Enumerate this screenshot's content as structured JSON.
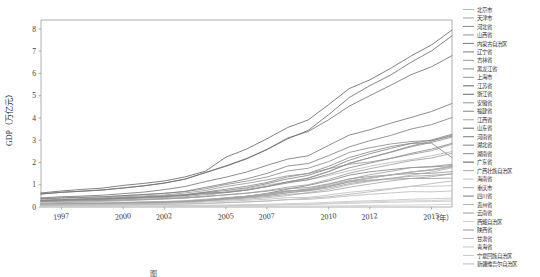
{
  "chart_data": {
    "type": "line",
    "title": "",
    "xlabel": "（年）",
    "ylabel": "GDP（万亿元）",
    "xlim": [
      1996,
      2016
    ],
    "ylim": [
      0,
      8.4
    ],
    "grid": false,
    "legend_position": "right",
    "x": [
      1996,
      1997,
      1998,
      1999,
      2000,
      2001,
      2002,
      2003,
      2004,
      2005,
      2006,
      2007,
      2008,
      2009,
      2010,
      2011,
      2012,
      2013,
      2014,
      2015,
      2016
    ],
    "xtick_labels": [
      "1997",
      "2000",
      "2002",
      "2005",
      "2007",
      "2010",
      "2012",
      "2015"
    ],
    "xtick_values": [
      1997,
      2000,
      2002,
      2005,
      2007,
      2010,
      2012,
      2015
    ],
    "ytick_labels": [
      "0",
      "1",
      "2",
      "3",
      "4",
      "5",
      "6",
      "7",
      "8"
    ],
    "ytick_values": [
      0,
      1,
      2,
      3,
      4,
      5,
      6,
      7,
      8
    ],
    "series": [
      {
        "name": "北京市",
        "color": "#b9b9b9",
        "values": [
          0.17,
          0.2,
          0.23,
          0.25,
          0.28,
          0.32,
          0.36,
          0.41,
          0.49,
          0.69,
          0.82,
          0.99,
          1.12,
          1.22,
          1.41,
          1.63,
          1.83,
          2.0,
          2.13,
          2.3,
          2.49
        ]
      },
      {
        "name": "天津市",
        "color": "#a8a8a8",
        "values": [
          0.11,
          0.12,
          0.14,
          0.15,
          0.16,
          0.18,
          0.21,
          0.25,
          0.31,
          0.37,
          0.44,
          0.51,
          0.64,
          0.75,
          0.92,
          1.13,
          1.29,
          1.44,
          1.57,
          1.65,
          1.79
        ]
      },
      {
        "name": "河北省",
        "color": "#8f8f8f",
        "values": [
          0.36,
          0.4,
          0.43,
          0.45,
          0.51,
          0.56,
          0.62,
          0.69,
          0.82,
          1.01,
          1.16,
          1.35,
          1.62,
          1.74,
          2.04,
          2.45,
          2.66,
          2.83,
          2.94,
          2.99,
          3.18
        ]
      },
      {
        "name": "山西省",
        "color": "#9d9d9d",
        "values": [
          0.13,
          0.14,
          0.16,
          0.15,
          0.17,
          0.18,
          0.2,
          0.25,
          0.31,
          0.42,
          0.48,
          0.6,
          0.73,
          0.74,
          0.92,
          1.12,
          1.21,
          1.26,
          1.28,
          1.28,
          1.3
        ]
      },
      {
        "name": "内蒙古自治区",
        "color": "#878787",
        "values": [
          0.1,
          0.11,
          0.12,
          0.13,
          0.14,
          0.16,
          0.18,
          0.21,
          0.27,
          0.39,
          0.48,
          0.61,
          0.8,
          0.97,
          1.17,
          1.43,
          1.58,
          1.68,
          1.77,
          1.8,
          1.86
        ]
      },
      {
        "name": "辽宁省",
        "color": "#8a8a8a",
        "values": [
          0.31,
          0.34,
          0.36,
          0.38,
          0.43,
          0.46,
          0.51,
          0.56,
          0.67,
          0.8,
          0.93,
          1.1,
          1.35,
          1.51,
          1.83,
          2.22,
          2.48,
          2.71,
          2.86,
          2.87,
          2.22
        ]
      },
      {
        "name": "吉林省",
        "color": "#a3a3a3",
        "values": [
          0.13,
          0.14,
          0.14,
          0.15,
          0.18,
          0.2,
          0.22,
          0.25,
          0.3,
          0.36,
          0.43,
          0.52,
          0.64,
          0.72,
          0.86,
          1.05,
          1.18,
          1.29,
          1.38,
          1.42,
          1.49
        ]
      },
      {
        "name": "黑龙江省",
        "color": "#969696",
        "values": [
          0.24,
          0.26,
          0.27,
          0.29,
          0.33,
          0.35,
          0.38,
          0.41,
          0.46,
          0.55,
          0.62,
          0.71,
          0.83,
          0.87,
          1.04,
          1.26,
          1.37,
          1.44,
          1.5,
          1.51,
          1.59
        ]
      },
      {
        "name": "上海市",
        "color": "#9b9b9b",
        "values": [
          0.29,
          0.33,
          0.37,
          0.41,
          0.46,
          0.5,
          0.54,
          0.63,
          0.74,
          0.92,
          1.06,
          1.22,
          1.4,
          1.5,
          1.72,
          1.92,
          2.02,
          2.18,
          2.36,
          2.53,
          2.82
        ]
      },
      {
        "name": "江苏省",
        "color": "#6f6f6f",
        "values": [
          0.58,
          0.66,
          0.71,
          0.76,
          0.86,
          0.95,
          1.07,
          1.25,
          1.54,
          1.83,
          2.16,
          2.58,
          3.06,
          3.44,
          4.15,
          4.92,
          5.45,
          5.92,
          6.5,
          7.01,
          7.69
        ]
      },
      {
        "name": "浙江省",
        "color": "#787878",
        "values": [
          0.41,
          0.46,
          0.49,
          0.53,
          0.6,
          0.67,
          0.78,
          0.92,
          1.14,
          1.34,
          1.57,
          1.87,
          2.15,
          2.3,
          2.77,
          3.23,
          3.47,
          3.76,
          4.02,
          4.29,
          4.65
        ]
      },
      {
        "name": "安徽省",
        "color": "#9f9f9f",
        "values": [
          0.24,
          0.27,
          0.28,
          0.29,
          0.3,
          0.33,
          0.36,
          0.4,
          0.48,
          0.54,
          0.62,
          0.74,
          0.89,
          1.0,
          1.24,
          1.52,
          1.72,
          1.9,
          2.08,
          2.2,
          2.41
        ]
      },
      {
        "name": "福建省",
        "color": "#8d8d8d",
        "values": [
          0.26,
          0.3,
          0.32,
          0.34,
          0.39,
          0.43,
          0.47,
          0.52,
          0.61,
          0.66,
          0.76,
          0.92,
          1.08,
          1.22,
          1.47,
          1.76,
          1.97,
          2.18,
          2.41,
          2.6,
          2.86
        ]
      },
      {
        "name": "江西省",
        "color": "#acacac",
        "values": [
          0.14,
          0.15,
          0.16,
          0.17,
          0.2,
          0.22,
          0.24,
          0.28,
          0.35,
          0.41,
          0.48,
          0.58,
          0.7,
          0.77,
          0.95,
          1.18,
          1.3,
          1.44,
          1.57,
          1.67,
          1.83
        ]
      },
      {
        "name": "山东省",
        "color": "#747474",
        "values": [
          0.59,
          0.66,
          0.71,
          0.77,
          0.85,
          0.95,
          1.08,
          1.25,
          1.55,
          1.85,
          2.18,
          2.59,
          3.1,
          3.39,
          3.92,
          4.53,
          5.0,
          5.46,
          5.94,
          6.3,
          6.8
        ]
      },
      {
        "name": "河南省",
        "color": "#828282",
        "values": [
          0.38,
          0.41,
          0.44,
          0.46,
          0.51,
          0.56,
          0.61,
          0.7,
          0.88,
          1.06,
          1.26,
          1.51,
          1.84,
          1.95,
          2.31,
          2.7,
          2.98,
          3.21,
          3.5,
          3.7,
          4.02
        ]
      },
      {
        "name": "湖北省",
        "color": "#8b8b8b",
        "values": [
          0.28,
          0.31,
          0.34,
          0.36,
          0.4,
          0.43,
          0.47,
          0.52,
          0.63,
          0.65,
          0.76,
          0.92,
          1.13,
          1.29,
          1.59,
          1.96,
          2.22,
          2.47,
          2.74,
          2.95,
          3.23
        ]
      },
      {
        "name": "湖南省",
        "color": "#949494",
        "values": [
          0.26,
          0.29,
          0.31,
          0.33,
          0.37,
          0.4,
          0.43,
          0.46,
          0.56,
          0.65,
          0.76,
          0.92,
          1.13,
          1.3,
          1.6,
          1.96,
          2.21,
          2.45,
          2.7,
          2.9,
          3.14
        ]
      },
      {
        "name": "广东省",
        "color": "#6a6a6a",
        "values": [
          0.63,
          0.72,
          0.79,
          0.85,
          0.97,
          1.06,
          1.17,
          1.35,
          1.61,
          2.24,
          2.6,
          3.07,
          3.57,
          3.91,
          4.6,
          5.32,
          5.71,
          6.22,
          6.78,
          7.28,
          7.95
        ]
      },
      {
        "name": "广西壮族自治区",
        "color": "#aeaeae",
        "values": [
          0.18,
          0.2,
          0.21,
          0.22,
          0.21,
          0.23,
          0.25,
          0.27,
          0.33,
          0.4,
          0.48,
          0.59,
          0.72,
          0.78,
          0.95,
          1.17,
          1.3,
          1.44,
          1.57,
          1.68,
          1.83
        ]
      },
      {
        "name": "海南省",
        "color": "#c4c4c4",
        "values": [
          0.04,
          0.04,
          0.04,
          0.05,
          0.05,
          0.05,
          0.06,
          0.07,
          0.08,
          0.09,
          0.11,
          0.12,
          0.15,
          0.17,
          0.21,
          0.25,
          0.28,
          0.31,
          0.35,
          0.37,
          0.4
        ]
      },
      {
        "name": "重庆市",
        "color": "#b0b0b0",
        "values": [
          0.11,
          0.13,
          0.14,
          0.15,
          0.16,
          0.17,
          0.2,
          0.23,
          0.27,
          0.31,
          0.35,
          0.42,
          0.51,
          0.65,
          0.79,
          1.0,
          1.15,
          1.27,
          1.43,
          1.57,
          1.76
        ]
      },
      {
        "name": "四川省",
        "color": "#868686",
        "values": [
          0.29,
          0.32,
          0.35,
          0.37,
          0.4,
          0.44,
          0.48,
          0.54,
          0.65,
          0.74,
          0.86,
          1.05,
          1.26,
          1.42,
          1.72,
          2.1,
          2.39,
          2.63,
          2.85,
          3.01,
          3.27
        ]
      },
      {
        "name": "贵州省",
        "color": "#b5b5b5",
        "values": [
          0.07,
          0.08,
          0.08,
          0.09,
          0.1,
          0.11,
          0.12,
          0.14,
          0.16,
          0.2,
          0.23,
          0.27,
          0.33,
          0.39,
          0.46,
          0.57,
          0.68,
          0.8,
          0.93,
          1.05,
          1.17
        ]
      },
      {
        "name": "云南省",
        "color": "#a6a6a6",
        "values": [
          0.14,
          0.15,
          0.16,
          0.17,
          0.2,
          0.21,
          0.23,
          0.25,
          0.3,
          0.35,
          0.4,
          0.47,
          0.57,
          0.62,
          0.72,
          0.89,
          1.03,
          1.17,
          1.28,
          1.36,
          1.49
        ]
      },
      {
        "name": "西藏自治区",
        "color": "#cfcfcf",
        "values": [
          0.01,
          0.01,
          0.01,
          0.01,
          0.01,
          0.01,
          0.02,
          0.02,
          0.02,
          0.02,
          0.03,
          0.03,
          0.04,
          0.04,
          0.05,
          0.06,
          0.07,
          0.08,
          0.09,
          0.1,
          0.12
        ]
      },
      {
        "name": "陕西省",
        "color": "#9e9e9e",
        "values": [
          0.12,
          0.13,
          0.14,
          0.15,
          0.17,
          0.19,
          0.21,
          0.23,
          0.29,
          0.37,
          0.45,
          0.55,
          0.7,
          0.82,
          1.01,
          1.25,
          1.45,
          1.6,
          1.77,
          1.82,
          1.92
        ]
      },
      {
        "name": "甘肃省",
        "color": "#bcbcbc",
        "values": [
          0.07,
          0.08,
          0.09,
          0.09,
          0.1,
          0.11,
          0.12,
          0.13,
          0.16,
          0.19,
          0.23,
          0.27,
          0.33,
          0.34,
          0.41,
          0.5,
          0.57,
          0.63,
          0.69,
          0.68,
          0.72
        ]
      },
      {
        "name": "青海省",
        "color": "#c9c9c9",
        "values": [
          0.02,
          0.02,
          0.02,
          0.02,
          0.03,
          0.03,
          0.03,
          0.04,
          0.05,
          0.06,
          0.07,
          0.08,
          0.1,
          0.1,
          0.14,
          0.16,
          0.19,
          0.21,
          0.23,
          0.24,
          0.26
        ]
      },
      {
        "name": "宁夏回族自治区",
        "color": "#cbcbcb",
        "values": [
          0.02,
          0.02,
          0.02,
          0.02,
          0.03,
          0.03,
          0.03,
          0.04,
          0.05,
          0.06,
          0.07,
          0.09,
          0.11,
          0.13,
          0.17,
          0.21,
          0.23,
          0.26,
          0.28,
          0.29,
          0.32
        ]
      },
      {
        "name": "新疆维吾尔自治区",
        "color": "#bfbfbf",
        "values": [
          0.09,
          0.1,
          0.11,
          0.11,
          0.14,
          0.15,
          0.16,
          0.19,
          0.22,
          0.26,
          0.3,
          0.35,
          0.42,
          0.43,
          0.54,
          0.66,
          0.75,
          0.83,
          0.93,
          0.93,
          0.96
        ]
      }
    ]
  },
  "axes": {
    "y_axis_title": "GDP（万亿元）",
    "x_axis_unit": "（年）"
  },
  "caption": {
    "text": "图"
  }
}
